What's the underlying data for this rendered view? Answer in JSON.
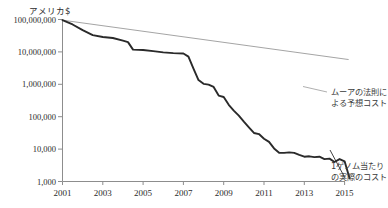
{
  "chart_data": {
    "type": "line",
    "title": "アメリカ$",
    "xlabel": "",
    "ylabel": "アメリカ$",
    "grid": false,
    "legend_position": "inline-annotation-right",
    "yscale": "log",
    "ylim": [
      1000,
      100000000
    ],
    "xlim": [
      2001,
      2015.6
    ],
    "ytick_labels": [
      "100,000,000",
      "10,000,000",
      "1,000,000",
      "100,000",
      "10,000",
      "1,000"
    ],
    "ytick_values": [
      100000000,
      10000000,
      1000000,
      100000,
      10000,
      1000
    ],
    "xtick_labels": [
      "2001",
      "2003",
      "2005",
      "2007",
      "2009",
      "2011",
      "2013",
      "2015"
    ],
    "xtick_values": [
      2001,
      2003,
      2005,
      2007,
      2009,
      2011,
      2013,
      2015
    ],
    "series": [
      {
        "name": "1ゲノム当たりの実際のコスト",
        "style": "thick-black",
        "color": "#2a2a2a",
        "x": [
          2001.0,
          2001.5,
          2002.0,
          2002.5,
          2003.0,
          2003.5,
          2004.0,
          2004.25,
          2004.5,
          2005.0,
          2005.5,
          2006.0,
          2006.5,
          2007.0,
          2007.25,
          2007.5,
          2007.75,
          2008.0,
          2008.25,
          2008.5,
          2008.75,
          2009.0,
          2009.25,
          2009.5,
          2009.75,
          2010.0,
          2010.25,
          2010.5,
          2010.75,
          2011.0,
          2011.25,
          2011.5,
          2011.75,
          2012.0,
          2012.25,
          2012.5,
          2012.75,
          2013.0,
          2013.25,
          2013.5,
          2013.75,
          2014.0,
          2014.25,
          2014.5,
          2014.75,
          2015.0,
          2015.25
        ],
        "y": [
          95263072,
          70175437,
          46774440,
          32940340,
          28780376,
          26910230,
          22205000,
          20000000,
          11732535,
          11495370,
          10540000,
          9640000,
          9170000,
          8927342,
          7147572,
          3063820,
          1352982,
          1031742,
          974016,
          827000,
          450000,
          405000,
          232735,
          154714,
          108065,
          70333,
          46774,
          31512,
          29092,
          20963,
          16712,
          10497,
          7743,
          7666,
          7950,
          7663,
          6618,
          5826,
          5985,
          5671,
          5826,
          4920,
          5096,
          4008,
          4920,
          4200,
          1245
        ]
      },
      {
        "name": "ムーアの法則による予想コスト",
        "style": "thin-gray",
        "color": "#9a9a9a",
        "x": [
          2001.0,
          2015.2
        ],
        "y": [
          95263072,
          5800000
        ]
      }
    ],
    "annotations": [
      {
        "name": "moore-law-label",
        "text_line1": "ムーアの法則に",
        "text_line2": "よる予想コスト"
      },
      {
        "name": "actual-cost-label",
        "text_line1": "1ゲノム当たり",
        "text_line2": "の実際のコスト"
      }
    ]
  }
}
